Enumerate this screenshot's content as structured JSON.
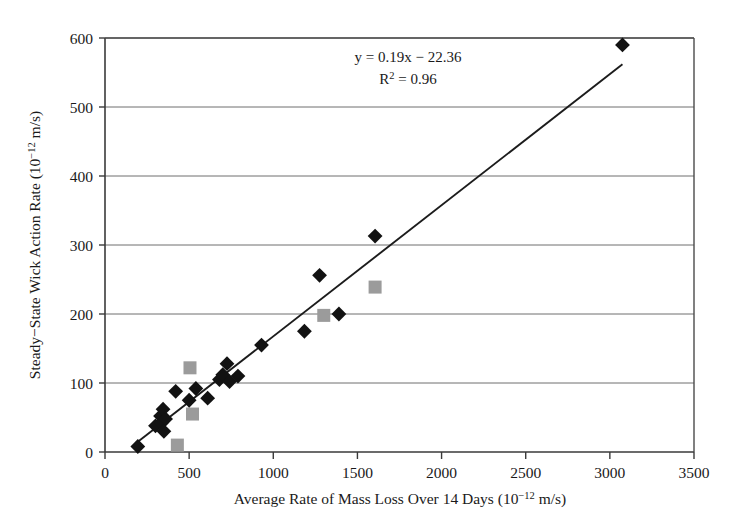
{
  "chart_data": {
    "type": "scatter",
    "title": "",
    "xlabel": "Average Rate of Mass Loss Over 14 Days (10−12 m/s)",
    "ylabel": "Steady−State Wick Action Rate (10−12 m/s)",
    "xlim": [
      0,
      3500
    ],
    "ylim": [
      0,
      600
    ],
    "xticks": [
      0,
      500,
      1000,
      1500,
      2000,
      2500,
      3000,
      3500
    ],
    "yticks": [
      0,
      100,
      200,
      300,
      400,
      500,
      600
    ],
    "grid": "horizontal",
    "legend": "none",
    "annotations": [
      "y = 0.19x − 22.36",
      "R2 = 0.96"
    ],
    "trendline": {
      "equation": "y = 0.19x − 22.36",
      "slope": 0.19,
      "intercept": -22.36,
      "r_squared": 0.96,
      "x_start": 180,
      "x_end": 3075
    },
    "series": [
      {
        "name": "black-diamond",
        "marker": "diamond",
        "color": "#121212",
        "points": [
          [
            195,
            8
          ],
          [
            300,
            38
          ],
          [
            330,
            52
          ],
          [
            335,
            42
          ],
          [
            345,
            62
          ],
          [
            350,
            30
          ],
          [
            360,
            48
          ],
          [
            420,
            88
          ],
          [
            500,
            75
          ],
          [
            540,
            92
          ],
          [
            610,
            78
          ],
          [
            680,
            105
          ],
          [
            700,
            112
          ],
          [
            725,
            128
          ],
          [
            740,
            102
          ],
          [
            790,
            110
          ],
          [
            930,
            155
          ],
          [
            1185,
            175
          ],
          [
            1275,
            256
          ],
          [
            1390,
            200
          ],
          [
            1605,
            313
          ],
          [
            3075,
            590
          ]
        ]
      },
      {
        "name": "gray-square",
        "marker": "square",
        "color": "#9b9b9b",
        "points": [
          [
            430,
            10
          ],
          [
            505,
            122
          ],
          [
            520,
            55
          ],
          [
            1300,
            198
          ],
          [
            1605,
            239
          ]
        ]
      }
    ]
  },
  "axis": {
    "x_tick_labels": [
      "0",
      "500",
      "1000",
      "1500",
      "2000",
      "2500",
      "3000",
      "3500"
    ],
    "y_tick_labels": [
      "0",
      "100",
      "200",
      "300",
      "400",
      "500",
      "600"
    ],
    "x_title_main": "Average Rate of Mass Loss Over 14 Days (10",
    "x_title_sup": "−12",
    "x_title_tail": " m/s)",
    "y_title_main": "Steady−State Wick Action Rate (10",
    "y_title_sup": "−12",
    "y_title_tail": " m/s)"
  },
  "annotation": {
    "equation": "y = 0.19x − 22.36",
    "r_base": "R",
    "r_sup": "2",
    "r_value": " = 0.96"
  },
  "colors": {
    "diamond": "#121212",
    "square": "#9b9b9b",
    "gridline": "#6e6e6e",
    "frame": "#4a4a4a",
    "trendline": "#1c1c1c",
    "text": "#1a1a1a",
    "background": "#ffffff"
  }
}
